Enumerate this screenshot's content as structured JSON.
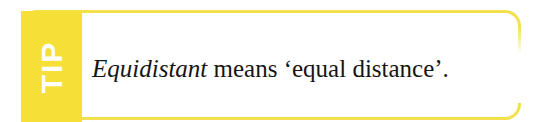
{
  "callout": {
    "type_label": "TIP",
    "body": {
      "term": "Equidistant",
      "rest": " means ‘equal distance’."
    },
    "colors": {
      "tab_fill": "#f6df37",
      "border": "#f3e04a",
      "tab_text": "#ffffff",
      "body_text": "#151515",
      "background": "#ffffff"
    }
  }
}
